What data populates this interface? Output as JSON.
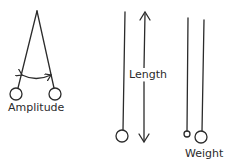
{
  "diagram": {
    "panels": [
      {
        "id": "amplitude",
        "label": "Amplitude"
      },
      {
        "id": "length",
        "label": "Length"
      },
      {
        "id": "weight",
        "label": "Weight"
      }
    ],
    "colors": {
      "stroke": "#2b2b2b",
      "background": "#ffffff"
    }
  }
}
